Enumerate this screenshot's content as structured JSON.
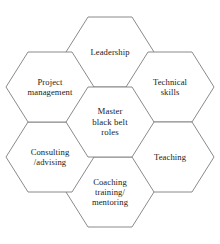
{
  "diagram": {
    "type": "hexagon-hub-and-spoke",
    "center": {
      "id": "master-black-belt-roles",
      "label": "Master\nblack belt\nroles",
      "cx": 110,
      "cy": 122
    },
    "nodes": [
      {
        "id": "leadership",
        "label": "Leadership",
        "cx": 110,
        "cy": 52,
        "position": "top"
      },
      {
        "id": "technical-skills",
        "label": "Technical\nskills",
        "cx": 170,
        "cy": 87,
        "position": "top-right"
      },
      {
        "id": "teaching",
        "label": "Teaching",
        "cx": 170,
        "cy": 157,
        "position": "bottom-right"
      },
      {
        "id": "coaching",
        "label": "Coaching\ntraining/\nmentoring",
        "cx": 110,
        "cy": 192,
        "position": "bottom"
      },
      {
        "id": "consulting",
        "label": "Consulting\n/advising",
        "cx": 50,
        "cy": 157,
        "position": "bottom-left"
      },
      {
        "id": "project-management",
        "label": "Project\nmanagement",
        "cx": 50,
        "cy": 87,
        "position": "top-left"
      }
    ],
    "connectors": [
      {
        "id": "leadership-to-technical",
        "from": "leadership",
        "to": "technical-skills"
      },
      {
        "id": "technical-to-teaching",
        "from": "technical-skills",
        "to": "teaching"
      },
      {
        "id": "teaching-to-coaching",
        "from": "teaching",
        "to": "coaching"
      },
      {
        "id": "coaching-to-consulting",
        "from": "coaching",
        "to": "consulting"
      },
      {
        "id": "consulting-to-project",
        "from": "consulting",
        "to": "project-management"
      }
    ],
    "colors": {
      "hex_fill": "#ffffff",
      "hex_stroke": "#7d7d7d",
      "connector_fill": "#c4c4c4",
      "text": "#1a1a1a",
      "background": "#ffffff"
    }
  }
}
